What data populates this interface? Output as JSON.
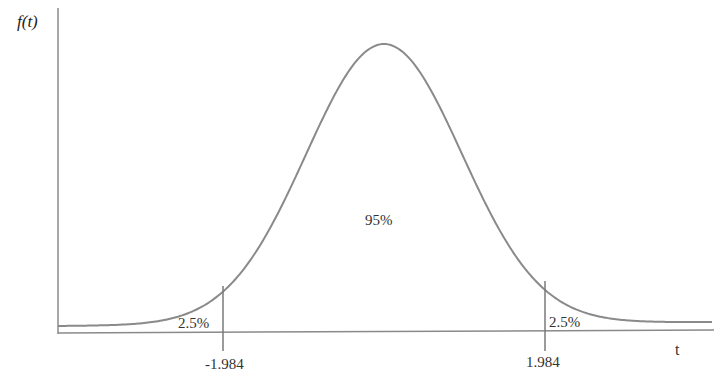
{
  "chart_data": {
    "type": "line",
    "title": "",
    "xlabel": "t",
    "ylabel": "f(t)",
    "critical_values": [
      -1.984,
      1.984
    ],
    "regions": [
      {
        "name": "left-tail",
        "label": "2.5%",
        "value": 2.5
      },
      {
        "name": "center",
        "label": "95%",
        "value": 95
      },
      {
        "name": "right-tail",
        "label": "2.5%",
        "value": 2.5
      }
    ],
    "tick_labels": [
      "-1.984",
      "1.984"
    ],
    "grid": false,
    "legend": null,
    "colors": {
      "curve": "#8a8a8a",
      "axes": "#8a8a8a",
      "text": "#333333"
    }
  },
  "labels": {
    "y_axis": "f(t)",
    "x_axis": "t",
    "center_pct": "95%",
    "left_pct": "2.5%",
    "right_pct": "2.5%",
    "left_tick": "-1.984",
    "right_tick": "1.984"
  }
}
